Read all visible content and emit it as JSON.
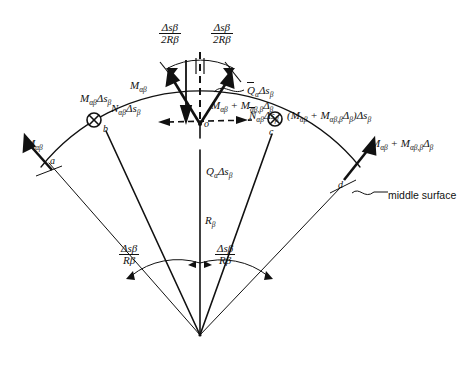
{
  "figure": {
    "type": "engineering-free-body-diagram",
    "caption": "",
    "points": [
      {
        "id": "a",
        "label": "a",
        "x": 49,
        "y": 160
      },
      {
        "id": "b",
        "label": "b",
        "x": 105,
        "y": 128
      },
      {
        "id": "o",
        "label": "o",
        "x": 200,
        "y": 124
      },
      {
        "id": "c",
        "label": "c",
        "x": 272,
        "y": 131
      },
      {
        "id": "d",
        "label": "d",
        "x": 341,
        "y": 184
      }
    ],
    "annotations": {
      "arc_left_angle": {
        "num": "Δs",
        "num_sub": "β",
        "den": "2R",
        "den_sub": "β"
      },
      "arc_right_angle": {
        "num": "Δs",
        "num_sub": "β",
        "den": "2R",
        "den_sub": "β"
      },
      "bottom_left_angle": {
        "num": "Δs",
        "num_sub": "β",
        "den": "R",
        "den_sub": "β"
      },
      "bottom_right_angle": {
        "num": "Δs",
        "num_sub": "β",
        "den": "R",
        "den_sub": "β"
      },
      "moment_left_edge": "M",
      "moment_left_edge_sub": "αβ",
      "moment_b": "M_{αβ}Δs_β",
      "normal_left": "N_{αβ}Δs_β",
      "shear_bar": "Q̄_α Δs_β",
      "moment_plus": "M_{αβ} + M_{αβ,β}Δ_β",
      "normal_bar": "N̄_{αβ}Δs_β",
      "moment_c": "(M_{αβ} + M_{αβ,β}Δ_β)Δs_β",
      "moment_right_edge": "M_{αβ} + M_{αβ,β}Δ_β",
      "shear_center": "Q_α Δs_β",
      "radius": "R_β",
      "middle_surface": "middle surface"
    },
    "colors": {
      "stroke": "#111111",
      "text": "#111111",
      "background": "#ffffff"
    }
  }
}
